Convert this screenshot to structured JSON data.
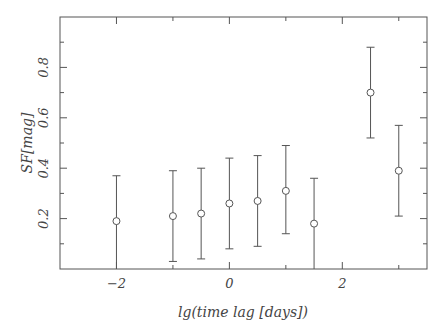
{
  "chart_data": {
    "type": "scatter",
    "title": "",
    "xlabel": "lg(time lag [days])",
    "ylabel": "SF[mag]",
    "xlim": [
      -3,
      3.5
    ],
    "ylim": [
      0,
      1.0
    ],
    "grid": false,
    "legend": null,
    "x_ticks": [
      -2,
      0,
      2
    ],
    "x_tick_labels": [
      "−2",
      "0",
      "2"
    ],
    "x_minor_ticks": [
      -3,
      -1,
      1,
      3
    ],
    "y_ticks": [
      0.2,
      0.4,
      0.6,
      0.8
    ],
    "y_tick_labels": [
      "0.2",
      "0.4",
      "0.6",
      "0.8"
    ],
    "y_minor_ticks": [
      0.1,
      0.3,
      0.5,
      0.7,
      0.9
    ],
    "marker": "open-circle",
    "error_bars": true,
    "series": [
      {
        "name": "SF",
        "x": [
          -2,
          -1,
          -0.5,
          0,
          0.5,
          1,
          1.5,
          2.5,
          3
        ],
        "y": [
          0.19,
          0.21,
          0.22,
          0.26,
          0.27,
          0.31,
          0.18,
          0.7,
          0.39
        ],
        "y_low": [
          0.0,
          0.03,
          0.04,
          0.08,
          0.09,
          0.14,
          0.0,
          0.52,
          0.21
        ],
        "y_high": [
          0.37,
          0.39,
          0.4,
          0.44,
          0.45,
          0.49,
          0.36,
          0.88,
          0.57
        ]
      }
    ]
  },
  "colors": {
    "axis": "#555555",
    "text": "#444444",
    "background": "#ffffff"
  }
}
